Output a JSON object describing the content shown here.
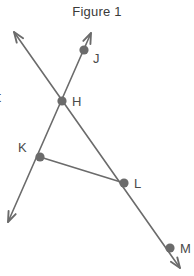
{
  "figure": {
    "title": "Figure 1",
    "background_color": "#ffffff",
    "stroke_color": "#6b6b6b",
    "dot_color": "#6b6b6b",
    "label_color": "#4a4a4a",
    "title_color": "#3a3a3a",
    "stroke_width": 1.6,
    "dot_radius": 4.6
  },
  "clipped_left_text": {
    "text": "t",
    "x": 0,
    "y": 90
  },
  "points": [
    {
      "id": "J",
      "label": "J",
      "x": 84,
      "y": 50,
      "label_x": 93,
      "label_y": 63
    },
    {
      "id": "H",
      "label": "H",
      "x": 62,
      "y": 101,
      "label_x": 72,
      "label_y": 106
    },
    {
      "id": "K",
      "label": "K",
      "x": 40,
      "y": 157,
      "label_x": 18,
      "label_y": 152
    },
    {
      "id": "L",
      "label": "L",
      "x": 124,
      "y": 183,
      "label_x": 134,
      "label_y": 188
    },
    {
      "id": "M",
      "label": "M",
      "x": 170,
      "y": 248,
      "label_x": 180,
      "label_y": 253
    }
  ],
  "segments": [
    {
      "name": "ray-upleft-through-H-to-M",
      "x1": 14,
      "y1": 32,
      "x2": 180,
      "y2": 268,
      "arrow_start": true,
      "arrow_end": true
    },
    {
      "name": "ray-J-through-H-to-lowerleft",
      "x1": 91,
      "y1": 33,
      "x2": 8,
      "y2": 222,
      "arrow_start": true,
      "arrow_end": true
    },
    {
      "name": "segment-K-to-L",
      "x1": 40,
      "y1": 157,
      "x2": 124,
      "y2": 183,
      "arrow_start": false,
      "arrow_end": false
    }
  ],
  "arrowheads": [
    {
      "name": "arrowhead-upper-left",
      "tip_x": 14,
      "tip_y": 32
    },
    {
      "name": "arrowhead-upper-right",
      "tip_x": 91,
      "tip_y": 33
    },
    {
      "name": "arrowhead-lower-left",
      "tip_x": 8,
      "tip_y": 222
    },
    {
      "name": "arrowhead-lower-right",
      "tip_x": 180,
      "tip_y": 268
    }
  ]
}
